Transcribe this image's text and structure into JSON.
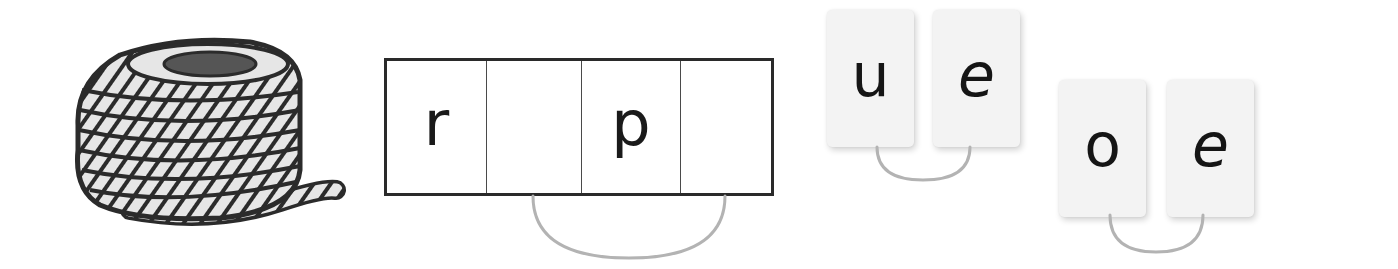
{
  "illustration": {
    "subject": "coiled rope",
    "icon": "rope-icon",
    "colors": {
      "outline": "#2b2b2b",
      "strand_fill": "#e6e6e6",
      "core": "#555555"
    }
  },
  "sound_boxes": {
    "cells": [
      {
        "letter": "r"
      },
      {
        "letter": ""
      },
      {
        "letter": "p"
      },
      {
        "letter": ""
      }
    ],
    "linked_cells": [
      2,
      4
    ],
    "colors": {
      "border": "#2a2a2a",
      "arc": "#b3b3b3"
    }
  },
  "letter_cards": {
    "pairs": [
      {
        "letters": [
          "u",
          "e"
        ]
      },
      {
        "letters": [
          "o",
          "e"
        ]
      }
    ],
    "colors": {
      "card_bg": "#f3f3f3",
      "letter": "#151515",
      "arc": "#b3b3b3"
    }
  }
}
